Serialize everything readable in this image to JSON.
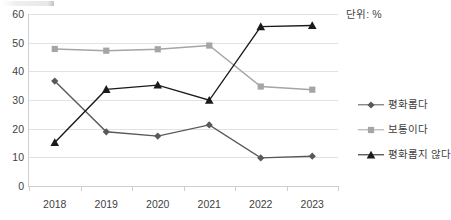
{
  "unit_note": "단위: %",
  "chart_data": {
    "type": "line",
    "title": "",
    "xlabel": "",
    "ylabel": "",
    "categories": [
      "2018",
      "2019",
      "2020",
      "2021",
      "2022",
      "2023"
    ],
    "ylim": [
      0,
      60
    ],
    "yticks": [
      0,
      10,
      20,
      30,
      40,
      50,
      60
    ],
    "grid": true,
    "legend_position": "right",
    "series": [
      {
        "name": "평화롭다",
        "marker": "diamond",
        "color": "#595959",
        "values": [
          36.6,
          18.9,
          17.4,
          21.3,
          9.8,
          10.4
        ]
      },
      {
        "name": "보통이다",
        "marker": "square",
        "color": "#a5a5a5",
        "values": [
          47.8,
          47.2,
          47.7,
          49.0,
          34.7,
          33.6
        ]
      },
      {
        "name": "평화롭지 않다",
        "marker": "triangle",
        "color": "#1a1a1a",
        "values": [
          15.2,
          33.7,
          35.2,
          29.9,
          55.6,
          56.0
        ]
      }
    ]
  }
}
